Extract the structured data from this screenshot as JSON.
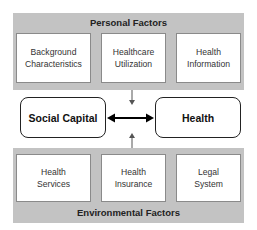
{
  "personal_factors": {
    "title": "Personal Factors",
    "items": [
      {
        "line1": "Background",
        "line2": "Characteristics"
      },
      {
        "line1": "Healthcare",
        "line2": "Utilization"
      },
      {
        "line1": "Health",
        "line2": "Information"
      }
    ]
  },
  "central": {
    "left_node": "Social Capital",
    "right_node": "Health",
    "relation": "bidirectional"
  },
  "environmental_factors": {
    "title": "Environmental Factors",
    "items": [
      {
        "line1": "Health",
        "line2": "Services"
      },
      {
        "line1": "Health",
        "line2": "Insurance"
      },
      {
        "line1": "Legal",
        "line2": "System"
      }
    ]
  },
  "colors": {
    "panel": "#c3c3c3",
    "box_border": "#8a8a8a",
    "node_border": "#222222",
    "arrow": "#555555"
  }
}
